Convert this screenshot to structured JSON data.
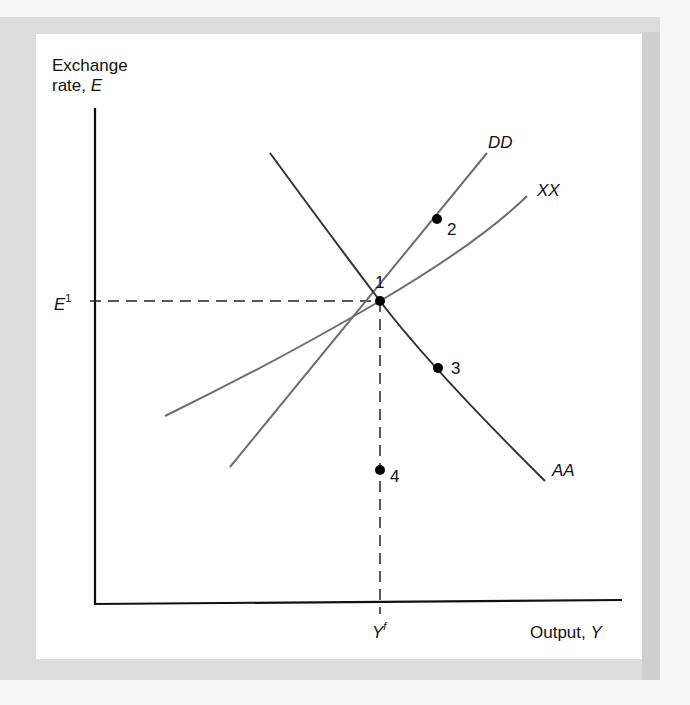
{
  "figure": {
    "y_axis_label_line1": "Exchange",
    "y_axis_label_line2": "rate, ",
    "y_axis_var": "E",
    "x_axis_label": "Output, ",
    "x_axis_var": "Y",
    "e1_label": "E",
    "e1_sup": "1",
    "yf_label": "Y",
    "yf_sup": "f",
    "curves": {
      "dd": "DD",
      "xx": "XX",
      "aa": "AA"
    },
    "points": [
      "1",
      "2",
      "3",
      "4"
    ]
  },
  "colors": {
    "axis": "#111111",
    "curve": "#6e6e6e",
    "aa_curve": "#333333",
    "panel": "#dcdcdc",
    "box": "#ffffff"
  }
}
